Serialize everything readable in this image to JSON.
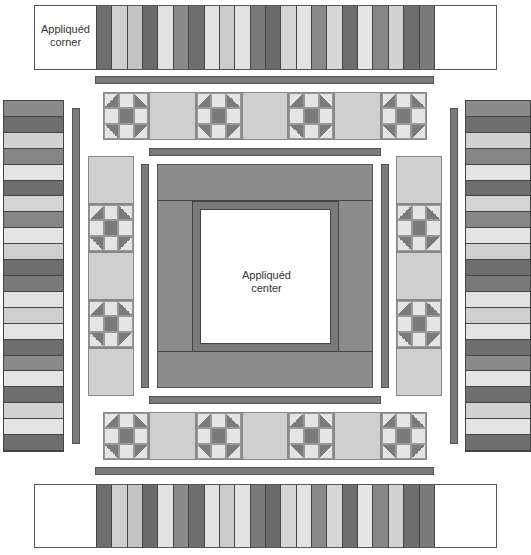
{
  "labels": {
    "corner": "Appliquéd\ncorner",
    "corner_line1": "Appliquéd",
    "corner_line2": "corner",
    "center_line1": "Appliquéd",
    "center_line2": "center"
  },
  "colors": {
    "dark": "#6e6e6e",
    "medium": "#8a8a8a",
    "light": "#cfcfcf",
    "very_light": "#e4e4e4",
    "center_frame": "#8c8c8c",
    "sashing": "#7a7a7a"
  },
  "horizontal_stripes": [
    "#6e6e6e",
    "#cfcfcf",
    "#c4c4c4",
    "#6a6a6a",
    "#e2e2e2",
    "#8a8a8a",
    "#6e6e6e",
    "#e2e2e2",
    "#cccccc",
    "#e2e2e2",
    "#7a7a7a",
    "#6a6a6a",
    "#d4d4d4",
    "#e4e4e4",
    "#8a8a8a",
    "#d6d6d6",
    "#6e6e6e",
    "#e6e6e6",
    "#868686",
    "#d2d2d2",
    "#6e6e6e",
    "#7a7a7a"
  ],
  "vertical_stripes": [
    "#8a8a8a",
    "#6e6e6e",
    "#d2d2d2",
    "#868686",
    "#e4e4e4",
    "#6e6e6e",
    "#d4d4d4",
    "#868686",
    "#e4e4e4",
    "#cfcfcf",
    "#6e6e6e",
    "#7a7a7a",
    "#e2e2e2",
    "#cfcfcf",
    "#e4e4e4",
    "#6e6e6e",
    "#8a8a8a",
    "#e4e4e4",
    "#6e6e6e",
    "#d2d2d2",
    "#e4e4e4",
    "#6e6e6e"
  ],
  "block_row_pattern": [
    "shoo",
    "plain",
    "shoo",
    "plain",
    "shoo",
    "plain",
    "shoo"
  ],
  "block_col_pattern": [
    "plain",
    "shoo",
    "plain",
    "shoo",
    "plain"
  ]
}
